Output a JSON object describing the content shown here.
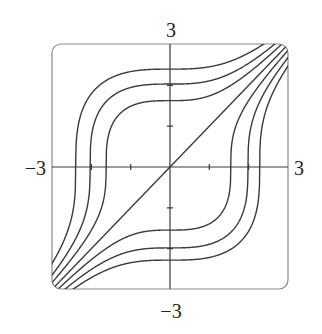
{
  "figure": {
    "type": "level-curves",
    "equation_family": "y^3 - x^3 = C",
    "frame": {
      "left": 52,
      "top": 44,
      "right": 288,
      "bottom": 289,
      "corner_radius": 9
    },
    "origin_px": {
      "x": 170,
      "y": 167
    },
    "scale_px": {
      "x": 39.3,
      "y": 40.8
    },
    "axis_labels": {
      "top": "3",
      "bottom": "−3",
      "left": "−3",
      "right": "3"
    },
    "ticks": [
      -2,
      -1,
      1,
      2
    ],
    "curve_constants": [
      13.8,
      8.4,
      4.3,
      0,
      -3.7,
      -7.8,
      -11.9
    ],
    "colors": {
      "curve": "#3a3a3a",
      "axis": "#3a3a3a",
      "frame": "#8a8a8a",
      "text": "#222222"
    }
  },
  "chart_data": {
    "type": "line",
    "title": "",
    "xlabel": "",
    "ylabel": "",
    "xlim": [
      -3,
      3
    ],
    "ylim": [
      -3,
      3
    ],
    "x_tick_labels": [
      "-3",
      "3"
    ],
    "y_tick_labels": [
      "-3",
      "3"
    ],
    "grid": false,
    "legend": null,
    "series": [
      {
        "name": "C=13.8",
        "equation": "y^3 - x^3 = 13.8",
        "x_intercept": -2.4,
        "y_intercept": 2.4
      },
      {
        "name": "C=8.4",
        "equation": "y^3 - x^3 = 8.4",
        "x_intercept": -2.03,
        "y_intercept": 2.03
      },
      {
        "name": "C=4.3",
        "equation": "y^3 - x^3 = 4.3",
        "x_intercept": -1.63,
        "y_intercept": 1.63
      },
      {
        "name": "C=0",
        "equation": "y = x",
        "x_intercept": 0,
        "y_intercept": 0
      },
      {
        "name": "C=-3.7",
        "equation": "y^3 - x^3 = -3.7",
        "x_intercept": 1.55,
        "y_intercept": -1.55
      },
      {
        "name": "C=-7.8",
        "equation": "y^3 - x^3 = -7.8",
        "x_intercept": 1.98,
        "y_intercept": -1.98
      },
      {
        "name": "C=-11.9",
        "equation": "y^3 - x^3 = -11.9",
        "x_intercept": 2.28,
        "y_intercept": -2.28
      }
    ]
  }
}
